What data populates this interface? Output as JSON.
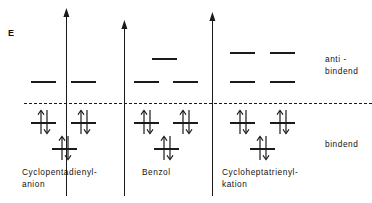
{
  "figure": {
    "energy_axis_label": "E",
    "nonbonding_reference": "dashed horizontal line"
  },
  "region_labels": {
    "antibonding": "anti -\nbindend",
    "bonding": "bindend"
  },
  "species": [
    {
      "id": "cyclopentadienyl-anion",
      "name": "Cyclopentadienyl-\nanion",
      "label_x": 22,
      "label_y": 166,
      "axis_x": 66,
      "axis_top": 16,
      "axis_bottom": 196,
      "levels": [
        {
          "x": 31,
          "y": 81,
          "w": 25,
          "electrons": 0
        },
        {
          "x": 71,
          "y": 81,
          "w": 25,
          "electrons": 0
        },
        {
          "x": 31,
          "y": 122,
          "w": 25,
          "electrons": 2
        },
        {
          "x": 71,
          "y": 122,
          "w": 25,
          "electrons": 2
        },
        {
          "x": 52,
          "y": 148,
          "w": 25,
          "electrons": 2
        }
      ]
    },
    {
      "id": "benzol",
      "name": "Benzol",
      "label_x": 142,
      "label_y": 166,
      "axis_x": 124,
      "axis_top": 28,
      "axis_bottom": 196,
      "levels": [
        {
          "x": 152,
          "y": 58,
          "w": 25,
          "electrons": 0
        },
        {
          "x": 134,
          "y": 81,
          "w": 25,
          "electrons": 0
        },
        {
          "x": 173,
          "y": 81,
          "w": 25,
          "electrons": 0
        },
        {
          "x": 134,
          "y": 122,
          "w": 25,
          "electrons": 2
        },
        {
          "x": 173,
          "y": 122,
          "w": 25,
          "electrons": 2
        },
        {
          "x": 154,
          "y": 148,
          "w": 25,
          "electrons": 2
        }
      ]
    },
    {
      "id": "cycloheptatrienyl-kation",
      "name": "Cycloheptatrienyl-\nkation",
      "label_x": 222,
      "label_y": 166,
      "axis_x": 212,
      "axis_top": 20,
      "axis_bottom": 196,
      "levels": [
        {
          "x": 230,
          "y": 52,
          "w": 25,
          "electrons": 0
        },
        {
          "x": 270,
          "y": 52,
          "w": 25,
          "electrons": 0
        },
        {
          "x": 230,
          "y": 81,
          "w": 25,
          "electrons": 0
        },
        {
          "x": 270,
          "y": 81,
          "w": 25,
          "electrons": 0
        },
        {
          "x": 230,
          "y": 122,
          "w": 25,
          "electrons": 2
        },
        {
          "x": 270,
          "y": 122,
          "w": 25,
          "electrons": 2
        },
        {
          "x": 250,
          "y": 148,
          "w": 25,
          "electrons": 2
        }
      ]
    }
  ],
  "chart_data": {
    "type": "diagram",
    "ylabel": "E",
    "nonbonding_level_y": 103,
    "series": [
      {
        "name": "Cyclopentadienyl-anion",
        "level_energies_px": [
          81,
          81,
          122,
          122,
          148
        ],
        "electrons_per_level": [
          0,
          0,
          2,
          2,
          2
        ],
        "total_pi_electrons": 6
      },
      {
        "name": "Benzol",
        "level_energies_px": [
          58,
          81,
          81,
          122,
          122,
          148
        ],
        "electrons_per_level": [
          0,
          0,
          0,
          2,
          2,
          2
        ],
        "total_pi_electrons": 6
      },
      {
        "name": "Cycloheptatrienyl-kation",
        "level_energies_px": [
          52,
          52,
          81,
          81,
          122,
          122,
          148
        ],
        "electrons_per_level": [
          0,
          0,
          0,
          0,
          2,
          2,
          2
        ],
        "total_pi_electrons": 6
      }
    ],
    "annotations": [
      "anti - bindend",
      "bindend"
    ]
  }
}
